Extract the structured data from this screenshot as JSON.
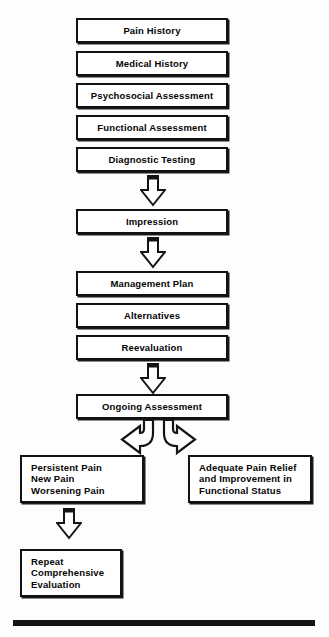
{
  "diagram": {
    "colors": {
      "background": "#fdfdfd",
      "box_fill": "#ffffff",
      "box_border": "#111111",
      "text": "#050505",
      "rule": "#141414"
    },
    "nodes": [
      {
        "id": "pain-history",
        "label": "Pain History",
        "align": "center"
      },
      {
        "id": "medical-history",
        "label": "Medical History",
        "align": "center"
      },
      {
        "id": "psychosocial-assessment",
        "label": "Psychosocial Assessment",
        "align": "center"
      },
      {
        "id": "functional-assessment",
        "label": "Functional Assessment",
        "align": "center"
      },
      {
        "id": "diagnostic-testing",
        "label": "Diagnostic Testing",
        "align": "center"
      },
      {
        "id": "impression",
        "label": "Impression",
        "align": "center"
      },
      {
        "id": "management-plan",
        "label": "Management Plan",
        "align": "center"
      },
      {
        "id": "alternatives",
        "label": "Alternatives",
        "align": "center"
      },
      {
        "id": "reevaluation",
        "label": "Reevaluation",
        "align": "center"
      },
      {
        "id": "ongoing-assessment",
        "label": "Ongoing Assessment",
        "align": "center"
      },
      {
        "id": "persistent-pain",
        "label": "Persistent Pain\nNew Pain\nWorsening Pain",
        "align": "left"
      },
      {
        "id": "adequate-relief",
        "label": "Adequate Pain Relief\nand Improvement in\nFunctional Status",
        "align": "left"
      },
      {
        "id": "repeat-evaluation",
        "label": "Repeat\nComprehensive\nEvaluation",
        "align": "left"
      }
    ],
    "connectors": [
      {
        "id": "arrow-diagnostic-to-impression",
        "type": "block-arrow-down"
      },
      {
        "id": "arrow-impression-to-management",
        "type": "block-arrow-down"
      },
      {
        "id": "arrow-reevaluation-to-ongoing",
        "type": "block-arrow-down"
      },
      {
        "id": "arrow-ongoing-to-persistent",
        "type": "curved-arrow-left"
      },
      {
        "id": "arrow-ongoing-to-adequate",
        "type": "curved-arrow-right"
      },
      {
        "id": "arrow-persistent-to-repeat",
        "type": "block-arrow-down"
      }
    ],
    "footer_rule": {
      "id": "footer-rule"
    }
  }
}
